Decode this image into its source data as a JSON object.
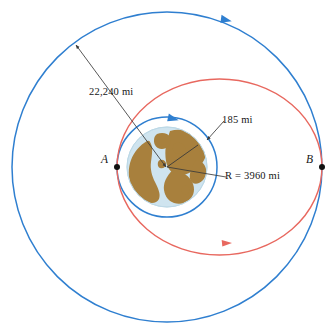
{
  "figure": {
    "background_color": "#ffffff"
  },
  "colors": {
    "outer_orbit": "#2f7fd0",
    "inner_orbit": "#2f7fd0",
    "transfer_orbit": "#e8685f",
    "leader_line": "#3a3a3a",
    "point_marker": "#111111",
    "earth_ocean": "#cfe4ef",
    "earth_land": "#a8803d",
    "earth_outline": "#bcd8e6",
    "label_text": "#161616"
  },
  "labels": {
    "outer_orbit_altitude": "22,240 mi",
    "inner_orbit_altitude": "185 mi",
    "earth_radius": "R = 3960 mi",
    "point_a": "A",
    "point_b": "B"
  },
  "geometry": {
    "center": {
      "x": 167,
      "y": 167
    },
    "outer_orbit_radius": 155,
    "inner_orbit_radius": 50,
    "earth_radius": 40,
    "point_a": {
      "x": 117,
      "y": 167
    },
    "point_b": {
      "x": 322,
      "y": 167
    },
    "transfer_ellipse": {
      "semi_major": 102.5,
      "semi_minor": 88,
      "center_x": 219.5,
      "center_y": 167
    },
    "leader_22240": {
      "x1": 76,
      "y1": 45,
      "x2": 166,
      "y2": 167
    },
    "leader_185": {
      "x1": 222,
      "y1": 122,
      "x2": 206,
      "y2": 140
    },
    "leader_R": {
      "x1": 167,
      "y1": 167,
      "x2": 224,
      "y2": 177
    },
    "radius_line_ne": {
      "x1": 167,
      "y1": 167,
      "x2": 198,
      "y2": 145
    }
  },
  "markers": {
    "outer_orbit_direction": "arrow-clockwise",
    "inner_orbit_direction": "arrow-clockwise",
    "transfer_orbit_direction": "arrow-rightward"
  }
}
